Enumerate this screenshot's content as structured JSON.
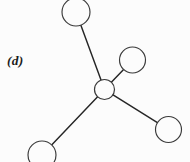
{
  "figure": {
    "panel_label": "(d)",
    "background_color": "#fcfcfc",
    "line_color": "#262626",
    "circle_stroke_color": "#3a3a3a",
    "circle_fill_color": "#fcfcfc",
    "width": 190,
    "height": 162
  },
  "chart_data": {
    "type": "diagram",
    "title": "(d)",
    "nodes": [
      {
        "id": "central",
        "label": "",
        "cx": 104.5,
        "cy": 89.5,
        "r": 10.0,
        "role": "central-atom"
      },
      {
        "id": "top",
        "label": "",
        "cx": 76.0,
        "cy": 12.0,
        "r": 14.0,
        "role": "terminal-atom"
      },
      {
        "id": "upper-right",
        "label": "",
        "cx": 132.5,
        "cy": 60.0,
        "r": 13.0,
        "role": "terminal-atom"
      },
      {
        "id": "lower-left",
        "label": "",
        "cx": 42.0,
        "cy": 155.0,
        "r": 14.0,
        "role": "terminal-atom"
      },
      {
        "id": "lower-right",
        "label": "",
        "cx": 168.5,
        "cy": 129.5,
        "r": 13.0,
        "role": "terminal-atom"
      }
    ],
    "edges": [
      {
        "from": "central",
        "to": "top",
        "kind": "single-bond"
      },
      {
        "from": "central",
        "to": "upper-right",
        "kind": "single-bond"
      },
      {
        "from": "central",
        "to": "lower-left",
        "kind": "single-bond"
      },
      {
        "from": "central",
        "to": "lower-right",
        "kind": "single-bond"
      }
    ],
    "node_count": 5,
    "edge_count": 4
  }
}
